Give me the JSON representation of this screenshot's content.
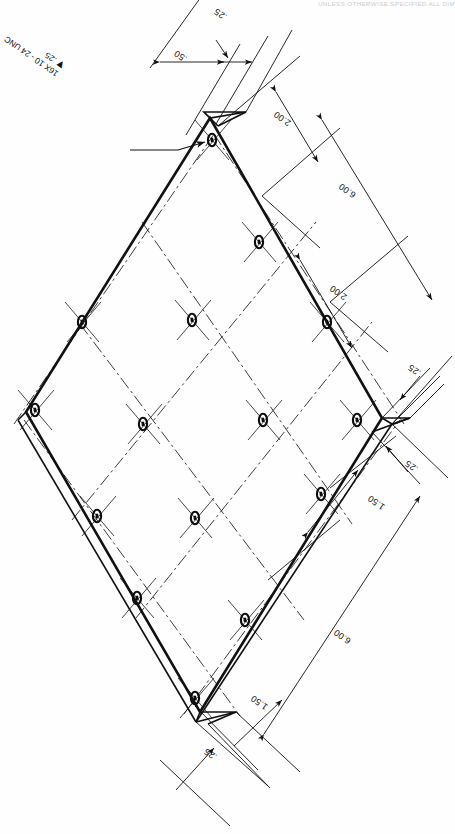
{
  "drawing": {
    "title_note": "UNLESS OTHERWISE SPECIFIED ALL DIMENSIONS",
    "type": "mechanical-part-drawing",
    "projection": "isometric",
    "part": "square mounting plate with 16 tapped holes",
    "line_color": "#111111",
    "paper_color": "#ffffff"
  },
  "callouts": {
    "thread": {
      "line1": "16X 10 - 24 UNC",
      "line2_symbol": "▼",
      "line2_value": ".25",
      "full": "16X 10 - 24 UNC ▼ .25"
    }
  },
  "dimensions": [
    {
      "id": "d-top-025",
      "value": ".25",
      "placement": "top-edge-right"
    },
    {
      "id": "d-top-050",
      "value": ".50",
      "placement": "top-edge-left"
    },
    {
      "id": "d-ur-200",
      "value": "2.00",
      "placement": "upper-right-spacing"
    },
    {
      "id": "d-ur-600",
      "value": "6.00",
      "placement": "upper-right-overall"
    },
    {
      "id": "d-mr-200",
      "value": "2.00",
      "placement": "mid-right-spacing"
    },
    {
      "id": "d-r-025-upper",
      "value": ".25",
      "placement": "right-corner-upper"
    },
    {
      "id": "d-r-025-lower",
      "value": ".25",
      "placement": "right-corner-lower"
    },
    {
      "id": "d-lr-150",
      "value": "1.50",
      "placement": "lower-right-edge-offset"
    },
    {
      "id": "d-lr-600",
      "value": "6.00",
      "placement": "lower-right-overall"
    },
    {
      "id": "d-b-150",
      "value": "1.50",
      "placement": "bottom-edge-offset"
    },
    {
      "id": "d-b-025",
      "value": ".25",
      "placement": "bottom-corner"
    }
  ],
  "geometry": {
    "hole_count": 16,
    "grid": "4 x 4",
    "plate_size": "6.00 x 6.00",
    "hole_spacing": "2.00",
    "edge_margin": "1.50",
    "plate_thickness": ".25",
    "hole_thread": "10-24 UNC",
    "hole_depth": ".25"
  }
}
